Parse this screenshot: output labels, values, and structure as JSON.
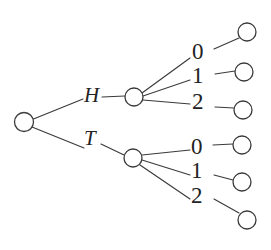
{
  "diagram": {
    "type": "probability-tree",
    "background_color": "#ffffff",
    "stroke_color": "#3a3a3a",
    "text_color": "#232323",
    "node_radius": 9,
    "nodes": [
      {
        "id": "root",
        "name": "root-node",
        "cx": 24,
        "cy": 122,
        "r": 9.5
      },
      {
        "id": "h",
        "name": "heads-node",
        "cx": 134,
        "cy": 97,
        "r": 9
      },
      {
        "id": "t",
        "name": "tails-node",
        "cx": 133,
        "cy": 158,
        "r": 9
      },
      {
        "id": "h0",
        "name": "leaf-node-h0",
        "cx": 247,
        "cy": 32,
        "r": 9
      },
      {
        "id": "h1",
        "name": "leaf-node-h1",
        "cx": 244,
        "cy": 72,
        "r": 9
      },
      {
        "id": "h2",
        "name": "leaf-node-h2",
        "cx": 243,
        "cy": 110,
        "r": 9
      },
      {
        "id": "t0",
        "name": "leaf-node-t0",
        "cx": 242,
        "cy": 145,
        "r": 9
      },
      {
        "id": "t1",
        "name": "leaf-node-t1",
        "cx": 242,
        "cy": 182,
        "r": 9
      },
      {
        "id": "t2",
        "name": "leaf-node-t2",
        "cx": 247,
        "cy": 220,
        "r": 9
      }
    ],
    "edges": [
      {
        "name": "edge-root-to-heads",
        "x1": 33.5,
        "y1": 119,
        "x2": 83,
        "y2": 99
      },
      {
        "name": "edge-root-to-tails",
        "x1": 32,
        "y1": 127,
        "x2": 84,
        "y2": 148
      },
      {
        "name": "edge-heads-label-to-heads-node",
        "x1": 102,
        "y1": 97,
        "x2": 125,
        "y2": 96
      },
      {
        "name": "edge-tails-label-to-tails-node",
        "x1": 101,
        "y1": 144,
        "x2": 124,
        "y2": 155
      },
      {
        "name": "edge-heads-to-0",
        "x1": 142,
        "y1": 93,
        "x2": 190,
        "y2": 58
      },
      {
        "name": "edge-heads-to-1",
        "x1": 143,
        "y1": 96,
        "x2": 190,
        "y2": 80
      },
      {
        "name": "edge-heads-to-2",
        "x1": 143,
        "y1": 100,
        "x2": 190,
        "y2": 104
      },
      {
        "name": "edge-tails-to-0",
        "x1": 142,
        "y1": 155,
        "x2": 190,
        "y2": 150
      },
      {
        "name": "edge-tails-to-1",
        "x1": 142,
        "y1": 160,
        "x2": 190,
        "y2": 175
      },
      {
        "name": "edge-tails-to-2",
        "x1": 140,
        "y1": 165,
        "x2": 190,
        "y2": 199
      },
      {
        "name": "edge-0-to-leaf-h0",
        "x1": 214,
        "y1": 49,
        "x2": 239,
        "y2": 38
      },
      {
        "name": "edge-1-to-leaf-h1",
        "x1": 215,
        "y1": 74,
        "x2": 235,
        "y2": 71
      },
      {
        "name": "edge-2-to-leaf-h2",
        "x1": 215,
        "y1": 107,
        "x2": 234,
        "y2": 108
      },
      {
        "name": "edge-0-to-leaf-t0",
        "x1": 213,
        "y1": 145,
        "x2": 233,
        "y2": 144
      },
      {
        "name": "edge-1-to-leaf-t1",
        "x1": 214,
        "y1": 175,
        "x2": 233,
        "y2": 180
      },
      {
        "name": "edge-2-to-leaf-t2",
        "x1": 214,
        "y1": 199,
        "x2": 239,
        "y2": 213
      }
    ],
    "labels": [
      {
        "id": "lbl-h",
        "name": "branch-label-heads",
        "text": "H",
        "style": "letter",
        "x": 84,
        "y": 85
      },
      {
        "id": "lbl-t",
        "name": "branch-label-tails",
        "text": "T",
        "style": "letter",
        "x": 84,
        "y": 128
      },
      {
        "id": "lbl-h0",
        "name": "branch-label-heads-0",
        "text": "0",
        "style": "digit",
        "x": 192,
        "y": 40
      },
      {
        "id": "lbl-h1",
        "name": "branch-label-heads-1",
        "text": "1",
        "style": "digit",
        "x": 192,
        "y": 64
      },
      {
        "id": "lbl-h2",
        "name": "branch-label-heads-2",
        "text": "2",
        "style": "digit",
        "x": 192,
        "y": 90
      },
      {
        "id": "lbl-t0",
        "name": "branch-label-tails-0",
        "text": "0",
        "style": "digit",
        "x": 191,
        "y": 135
      },
      {
        "id": "lbl-t1",
        "name": "branch-label-tails-1",
        "text": "1",
        "style": "digit",
        "x": 191,
        "y": 159
      },
      {
        "id": "lbl-t2",
        "name": "branch-label-tails-2",
        "text": "2",
        "style": "digit",
        "x": 191,
        "y": 184
      }
    ]
  }
}
